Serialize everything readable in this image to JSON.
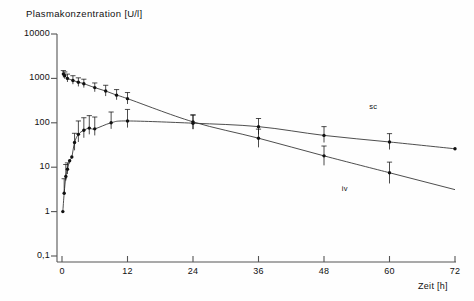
{
  "title": {
    "text": "Plasmakonzentration",
    "unit": "[U/l]"
  },
  "axes": {
    "xlabel": "Zeit",
    "xunit": "[h]",
    "xticks": [
      "0",
      "12",
      "24",
      "36",
      "48",
      "60",
      "72"
    ],
    "xtickvalues": [
      0,
      12,
      24,
      36,
      48,
      60,
      72
    ],
    "yticks": [
      "10000",
      "1000",
      "100",
      "10",
      "1",
      "0,1"
    ],
    "ytickvalues": [
      10000,
      1000,
      100,
      10,
      1,
      0.1
    ],
    "xlim": [
      0,
      72
    ],
    "ylim": [
      0.1,
      10000
    ],
    "yscale": "log",
    "grid": "off"
  },
  "annotations": [
    {
      "text": "sc",
      "x": 57,
      "y": 230
    },
    {
      "text": "iv",
      "x": 52,
      "y": 3.3
    }
  ],
  "chart_data": {
    "type": "line",
    "title": "Plasmakonzentration [U/l]",
    "xlabel": "Zeit [h]",
    "ylabel": "Plasmakonzentration [U/l]",
    "xlim": [
      0,
      72
    ],
    "ylim": [
      0.1,
      10000
    ],
    "yscale": "log",
    "grid": "off",
    "legend_position": "inline-annotation",
    "series": [
      {
        "name": "iv",
        "label": "iv",
        "marker": "filled-circle",
        "errorbars": true,
        "points": [
          {
            "x": 0.25,
            "y": 1250,
            "elo": 1050,
            "ehi": 1500
          },
          {
            "x": 0.5,
            "y": 1150,
            "elo": 980,
            "ehi": 1400
          },
          {
            "x": 1,
            "y": 1000,
            "elo": 830,
            "ehi": 1250
          },
          {
            "x": 2,
            "y": 900,
            "elo": 740,
            "ehi": 1150
          },
          {
            "x": 3,
            "y": 820,
            "elo": 660,
            "ehi": 1030
          },
          {
            "x": 4,
            "y": 760,
            "elo": 620,
            "ehi": 960
          },
          {
            "x": 6,
            "y": 620,
            "elo": 500,
            "ehi": 790
          },
          {
            "x": 8,
            "y": 520,
            "elo": 400,
            "ehi": 700
          },
          {
            "x": 10,
            "y": 420,
            "elo": 330,
            "ehi": 560
          },
          {
            "x": 12,
            "y": 350,
            "elo": 265,
            "ehi": 480
          },
          {
            "x": 24,
            "y": 105,
            "elo": 72,
            "ehi": 150
          },
          {
            "x": 36,
            "y": 45,
            "elo": 28,
            "ehi": 72
          },
          {
            "x": 48,
            "y": 18,
            "elo": 11,
            "ehi": 30
          },
          {
            "x": 60,
            "y": 7.5,
            "elo": 4.3,
            "ehi": 13
          }
        ]
      },
      {
        "name": "sc",
        "label": "sc",
        "marker": "filled-circle",
        "errorbars": true,
        "points": [
          {
            "x": 0.15,
            "y": 1.0,
            "elo": 1.0,
            "ehi": 1.0
          },
          {
            "x": 0.4,
            "y": 2.6,
            "elo": 2.6,
            "ehi": 5.5
          },
          {
            "x": 0.7,
            "y": 6.2,
            "elo": 5.0,
            "ehi": 11.5
          },
          {
            "x": 1.0,
            "y": 9.0,
            "elo": 7.0,
            "ehi": 12.5
          },
          {
            "x": 1.4,
            "y": 14,
            "elo": 14,
            "ehi": 14
          },
          {
            "x": 1.8,
            "y": 17,
            "elo": 17,
            "ehi": 17
          },
          {
            "x": 2.3,
            "y": 36,
            "elo": 24,
            "ehi": 58
          },
          {
            "x": 3.0,
            "y": 55,
            "elo": 37,
            "ehi": 110
          },
          {
            "x": 4.0,
            "y": 68,
            "elo": 46,
            "ehi": 130
          },
          {
            "x": 5.0,
            "y": 76,
            "elo": 55,
            "ehi": 145
          },
          {
            "x": 6.0,
            "y": 73,
            "elo": 52,
            "ehi": 135
          },
          {
            "x": 9.0,
            "y": 100,
            "elo": 73,
            "ehi": 175
          },
          {
            "x": 12.0,
            "y": 110,
            "elo": 78,
            "ehi": 200
          },
          {
            "x": 24.0,
            "y": 98,
            "elo": 72,
            "ehi": 150
          },
          {
            "x": 36.0,
            "y": 82,
            "elo": 55,
            "ehi": 125
          },
          {
            "x": 48.0,
            "y": 52,
            "elo": 36,
            "ehi": 82
          },
          {
            "x": 60.0,
            "y": 37,
            "elo": 25,
            "ehi": 57
          },
          {
            "x": 72.0,
            "y": 26,
            "elo": 26,
            "ehi": 26
          }
        ]
      }
    ]
  },
  "style": {
    "line_color": "#3a3a3a",
    "marker_color": "#111111",
    "axis_color": "#555555",
    "background": "#fefefe"
  }
}
